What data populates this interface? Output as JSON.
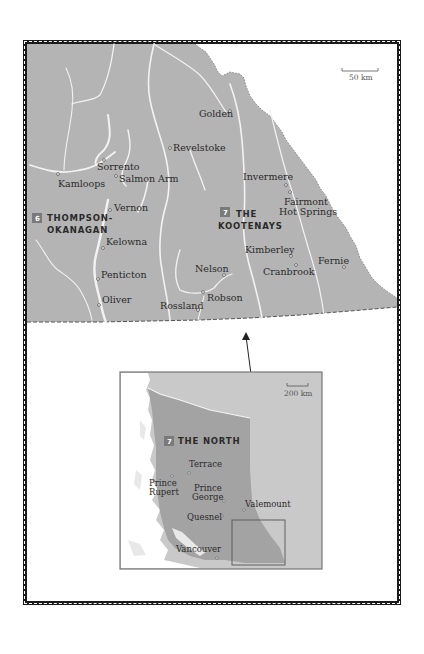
{
  "main_map": {
    "scale_label": "50 km",
    "regions": [
      {
        "number": "6",
        "line1": "THOMPSON-",
        "line2": "OKANAGAN"
      },
      {
        "number": "7",
        "line1": "THE",
        "line2": "KOOTENAYS"
      }
    ],
    "places": [
      {
        "name": "Golden"
      },
      {
        "name": "Revelstoke"
      },
      {
        "name": "Sorrento"
      },
      {
        "name": "Salmon Arm"
      },
      {
        "name": "Kamloops"
      },
      {
        "name": "Invermere"
      },
      {
        "name": "Fairmont",
        "line2": "Hot Springs"
      },
      {
        "name": "Vernon"
      },
      {
        "name": "Kelowna"
      },
      {
        "name": "Kimberley"
      },
      {
        "name": "Cranbrook"
      },
      {
        "name": "Fernie"
      },
      {
        "name": "Penticton"
      },
      {
        "name": "Nelson"
      },
      {
        "name": "Robson"
      },
      {
        "name": "Oliver"
      },
      {
        "name": "Rossland"
      }
    ]
  },
  "inset_map": {
    "scale_label": "200 km",
    "region": {
      "number": "7",
      "label": "THE NORTH"
    },
    "places": [
      {
        "name": "Terrace"
      },
      {
        "name": "Prince",
        "line2": "Rupert"
      },
      {
        "name": "Prince",
        "line2": "George"
      },
      {
        "name": "Valemount"
      },
      {
        "name": "Quesnel"
      },
      {
        "name": "Vancouver"
      }
    ]
  },
  "colors": {
    "land": "#b4b4b4",
    "inset_land_light": "#c9c9c9",
    "inset_region": "#a3a3a3",
    "water": "#ffffff",
    "badge": "#7a7a7a",
    "frame": "#1a1a1a"
  }
}
